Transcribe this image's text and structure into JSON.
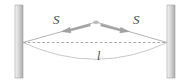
{
  "figure": {
    "labels": {
      "tension_left": "S",
      "tension_right": "S",
      "length": "l"
    },
    "colors": {
      "wall_fill_light": "#f2f2f2",
      "wall_fill_mid": "#d9d9d9",
      "wall_fill_dark": "#b8b8b8",
      "wall_stroke": "#9a9a9a",
      "line": "#8c8c8c",
      "dashed_line": "#8c8c8c",
      "arrow": "#a6a6a6",
      "arrow_dark": "#8a8a8a",
      "label_text": "#4a4a4a",
      "background": "#ffffff"
    },
    "geometry": {
      "left_wall": {
        "x": 15,
        "y": 5,
        "width": 8,
        "height": 73
      },
      "right_wall": {
        "x": 167,
        "y": 5,
        "width": 8,
        "height": 73
      },
      "anchor_left": {
        "x": 23,
        "y": 42
      },
      "anchor_right": {
        "x": 167,
        "y": 42
      },
      "apex": {
        "x": 96,
        "y": 22
      },
      "sag_bottom": {
        "x": 96,
        "y": 61
      },
      "chord_style": "dashed"
    }
  }
}
